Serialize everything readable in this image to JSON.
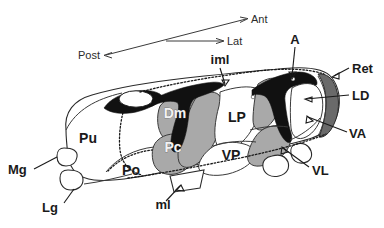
{
  "figure": {
    "type": "anatomical-diagram",
    "background_color": "#ffffff",
    "ink_color": "#1a1a1a"
  },
  "orientation_key": {
    "axes": [
      {
        "id": "ant",
        "label": "Ant",
        "direction": "upper-right"
      },
      {
        "id": "lat",
        "label": "Lat",
        "direction": "right"
      },
      {
        "id": "post",
        "label": "Post",
        "direction": "lower-left"
      }
    ]
  },
  "palette": {
    "white_region": "#ffffff",
    "light_gray_region": "#aeaeae",
    "mid_gray_region": "#9b9b9b",
    "dark_gray_band": "#6a6a6a",
    "black_lamina": "#111111",
    "outline": "#2a2a2a",
    "label_text": "#1a1a1a",
    "label_text_inverse": "#f2f2f2"
  },
  "internal_labels": [
    {
      "id": "pu",
      "label": "Pu",
      "style": "dark-on-white",
      "x": 88,
      "y": 143
    },
    {
      "id": "po",
      "label": "Po",
      "style": "dark-on-white",
      "x": 131,
      "y": 175
    },
    {
      "id": "dm",
      "label": "Dm",
      "style": "white-on-gray",
      "x": 175,
      "y": 118
    },
    {
      "id": "pc",
      "label": "Pc",
      "style": "white-on-gray",
      "x": 173,
      "y": 152
    },
    {
      "id": "lp",
      "label": "LP",
      "style": "dark-on-white",
      "x": 227,
      "y": 120
    },
    {
      "id": "vp",
      "label": "VP",
      "style": "dark-on-white",
      "x": 231,
      "y": 157
    }
  ],
  "callout_labels": [
    {
      "id": "iml",
      "label": "iml",
      "x": 220,
      "y": 62,
      "anchor": "middle",
      "target": "internal medullary lamina"
    },
    {
      "id": "a",
      "label": "A",
      "x": 295,
      "y": 42,
      "anchor": "middle",
      "target": "anterior nucleus"
    },
    {
      "id": "ret",
      "label": "Ret",
      "x": 352,
      "y": 72,
      "anchor": "start",
      "target": "reticular nucleus"
    },
    {
      "id": "ld",
      "label": "LD",
      "x": 352,
      "y": 99,
      "anchor": "start",
      "target": "lateral dorsal nucleus"
    },
    {
      "id": "va",
      "label": "VA",
      "x": 349,
      "y": 137,
      "anchor": "start",
      "target": "ventral anterior nucleus"
    },
    {
      "id": "vl",
      "label": "VL",
      "x": 310,
      "y": 172,
      "anchor": "start",
      "target": "ventral lateral nucleus"
    },
    {
      "id": "mg",
      "label": "Mg",
      "x": 8,
      "y": 173,
      "anchor": "start",
      "target": "medial geniculate body"
    },
    {
      "id": "lg",
      "label": "Lg",
      "x": 42,
      "y": 211,
      "anchor": "start",
      "target": "lateral geniculate body"
    },
    {
      "id": "ml",
      "label": "ml",
      "x": 163,
      "y": 206,
      "anchor": "middle",
      "target": "medial lemniscus"
    }
  ]
}
